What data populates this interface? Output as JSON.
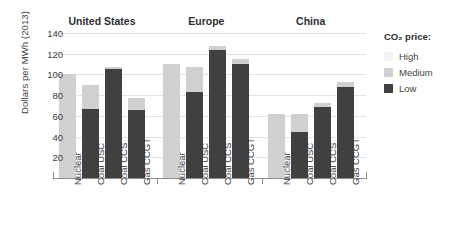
{
  "chart_data": {
    "type": "bar",
    "title": "",
    "subtitle": "",
    "xlabel": "",
    "ylabel": "Dollars per MWh (2013)",
    "ylim": [
      0,
      140
    ],
    "yticks": [
      20,
      40,
      60,
      80,
      100,
      120,
      140
    ],
    "grid": true,
    "stacked": true,
    "legend_position": "right",
    "legend_title": "CO₂ price:",
    "groups": [
      "United States",
      "Europe",
      "China"
    ],
    "categories": [
      "Nuclear",
      "Coal USC",
      "Coal CCS",
      "Gas CCGT"
    ],
    "series": [
      {
        "name": "Low",
        "color": "#404040"
      },
      {
        "name": "Medium",
        "color": "#d0d0d0"
      },
      {
        "name": "High",
        "color": "#f5f5f5"
      }
    ],
    "data": [
      {
        "group": "United States",
        "bars": [
          {
            "category": "Nuclear",
            "low": 0,
            "medium": 100,
            "high": 100,
            "total": 100
          },
          {
            "category": "Coal USC",
            "low": 67,
            "medium": 90,
            "high": 90,
            "total": 90
          },
          {
            "category": "Coal CCS",
            "low": 105,
            "medium": 107,
            "high": 107,
            "total": 107
          },
          {
            "category": "Gas CCGT",
            "low": 66,
            "medium": 77,
            "high": 77,
            "total": 77
          }
        ]
      },
      {
        "group": "Europe",
        "bars": [
          {
            "category": "Nuclear",
            "low": 0,
            "medium": 110,
            "high": 110,
            "total": 110
          },
          {
            "category": "Coal USC",
            "low": 83,
            "medium": 107,
            "high": 107,
            "total": 107
          },
          {
            "category": "Coal CCS",
            "low": 124,
            "medium": 127,
            "high": 127,
            "total": 127
          },
          {
            "category": "Gas CCGT",
            "low": 110,
            "medium": 115,
            "high": 115,
            "total": 115
          }
        ]
      },
      {
        "group": "China",
        "bars": [
          {
            "category": "Nuclear",
            "low": 0,
            "medium": 62,
            "high": 62,
            "total": 62
          },
          {
            "category": "Coal USC",
            "low": 44,
            "medium": 62,
            "high": 62,
            "total": 62
          },
          {
            "category": "Coal CCS",
            "low": 69,
            "medium": 72,
            "high": 72,
            "total": 72
          },
          {
            "category": "Gas CCGT",
            "low": 88,
            "medium": 93,
            "high": 93,
            "total": 93
          }
        ]
      }
    ]
  },
  "legend": {
    "title": "CO₂ price:",
    "items": [
      {
        "label": "High",
        "color": "#f5f5f5"
      },
      {
        "label": "Medium",
        "color": "#d0d0d0"
      },
      {
        "label": "Low",
        "color": "#404040"
      }
    ]
  },
  "axis": {
    "y_title": "Dollars per MWh (2013)"
  },
  "top_caption": ""
}
